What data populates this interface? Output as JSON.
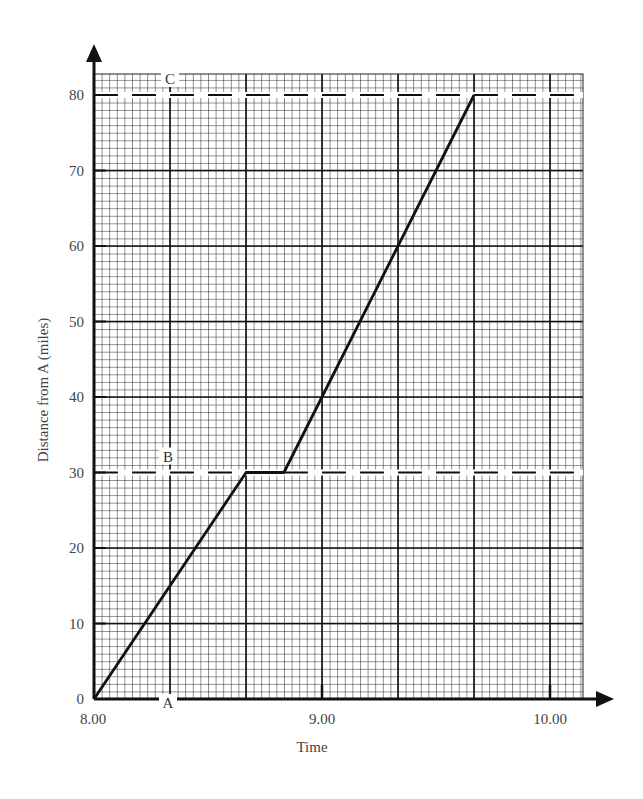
{
  "chart_data": {
    "type": "line",
    "title": "",
    "xlabel": "Time",
    "ylabel": "Distance from A (miles)",
    "x_tick_labels": [
      "8.00",
      "9.00",
      "10.00"
    ],
    "y_tick_labels": [
      "0",
      "10",
      "20",
      "30",
      "40",
      "50",
      "60",
      "70",
      "80"
    ],
    "xlim": [
      8.0,
      10.14
    ],
    "ylim": [
      0,
      82.8
    ],
    "grid": true,
    "x_unit": "hours (decimal, 8.00 = 8 o'clock)",
    "series": [
      {
        "name": "Journey",
        "x": [
          "8:00",
          "8:40",
          "8:50",
          "9:40"
        ],
        "x_hours": [
          8.0,
          8.667,
          8.833,
          9.667
        ],
        "y": [
          0,
          30,
          30,
          80
        ]
      }
    ],
    "reference_lines": [
      {
        "label": "B",
        "y": 30,
        "style": "dashed"
      },
      {
        "label": "C",
        "y": 80,
        "style": "dashed"
      }
    ],
    "annotations": [
      {
        "text": "A",
        "y": 0
      },
      {
        "text": "B",
        "y": 30
      },
      {
        "text": "C",
        "y": 80
      }
    ]
  },
  "labels": {
    "xlabel": "Time",
    "ylabel": "Distance from A (miles)",
    "point_a": "A",
    "point_b": "B",
    "point_c": "C"
  }
}
